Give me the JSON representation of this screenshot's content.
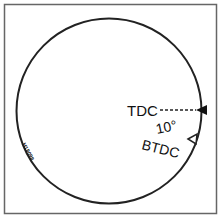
{
  "diagram": {
    "labels": {
      "tdc": "TDC",
      "angle": "10°",
      "btdc": "BTDC",
      "figure_code": "H18098"
    },
    "colors": {
      "line": "#222222",
      "background": "#ffffff",
      "frame": "#555555"
    }
  }
}
